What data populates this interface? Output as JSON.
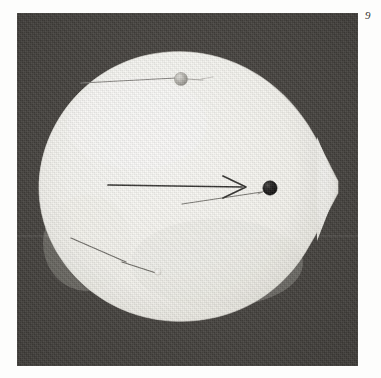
{
  "page": {
    "number": "9",
    "background_color": "#fdfdfc"
  },
  "plate": {
    "name": "photographic-plate",
    "background_color": "#46433f",
    "left": 17,
    "top": 13,
    "width": 341,
    "height": 353,
    "caption": ""
  },
  "specimen": {
    "name": "egg-specimen",
    "shape": "teardrop",
    "fill_color": "#f6f5f1",
    "edge_color": "#e8e6df",
    "description": "Large pale egg-shaped specimen with a pointed right-hand pole, photographed against a dark background."
  },
  "annotations": {
    "arrow": {
      "label": "",
      "color": "#2b2a27",
      "direction": "right",
      "x1": 108,
      "y1": 185,
      "x2": 244,
      "y2": 187
    },
    "markers": [
      {
        "name": "pin-head-gray",
        "color": "#b9b7b1",
        "cx": 181,
        "cy": 79,
        "r": 6.5,
        "label": ""
      },
      {
        "name": "pin-head-black",
        "color": "#171614",
        "cx": 270,
        "cy": 188,
        "r": 7,
        "label": ""
      },
      {
        "name": "pin-head-white",
        "color": "#ecebe6",
        "cx": 158,
        "cy": 272,
        "r": 3.2,
        "label": ""
      }
    ],
    "needles": [
      {
        "name": "needle-upper",
        "x1": 81,
        "y1": 83,
        "x2": 176,
        "y2": 78
      },
      {
        "name": "needle-upper-tip",
        "x1": 186,
        "y1": 79,
        "x2": 201,
        "y2": 80
      },
      {
        "name": "needle-center-lower",
        "x1": 182,
        "y1": 204,
        "x2": 262,
        "y2": 192
      },
      {
        "name": "needle-center-tip",
        "x1": 258,
        "y1": 194,
        "x2": 275,
        "y2": 186
      },
      {
        "name": "needle-lower-long",
        "x1": 71,
        "y1": 238,
        "x2": 126,
        "y2": 262
      },
      {
        "name": "needle-lower-short",
        "x1": 122,
        "y1": 262,
        "x2": 156,
        "y2": 273
      }
    ]
  }
}
